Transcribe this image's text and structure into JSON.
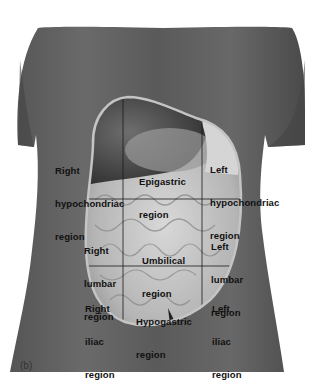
{
  "figure": {
    "panel_label": "(b)",
    "colors": {
      "background": "#ffffff",
      "skin_dark": "#3a3a3a",
      "skin_mid": "#5c5c5c",
      "organ_light": "#cfcfcf",
      "oval_border": "#bdbdbd",
      "grid_line": "#1a1a1a",
      "label_text": "#111111"
    },
    "regions": [
      {
        "id": "right-hypochondriac",
        "lines": [
          "Right",
          "hypochondriac",
          "region"
        ]
      },
      {
        "id": "epigastric",
        "lines": [
          "Epigastric",
          "region"
        ]
      },
      {
        "id": "left-hypochondriac",
        "lines": [
          "Left",
          "hypochondriac",
          "region"
        ]
      },
      {
        "id": "right-lumbar",
        "lines": [
          "Right",
          "lumbar",
          "region"
        ]
      },
      {
        "id": "umbilical",
        "lines": [
          "Umbilical",
          "region"
        ]
      },
      {
        "id": "left-lumbar",
        "lines": [
          "Left",
          "lumbar",
          "region"
        ]
      },
      {
        "id": "right-iliac",
        "lines": [
          "Right",
          "iliac",
          "region"
        ]
      },
      {
        "id": "hypogastric",
        "lines": [
          "Hypogastric",
          "region"
        ]
      },
      {
        "id": "left-iliac",
        "lines": [
          "Left",
          "iliac",
          "region"
        ]
      }
    ]
  }
}
